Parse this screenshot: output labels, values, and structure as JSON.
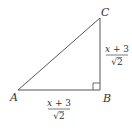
{
  "diagram": {
    "type": "right-triangle",
    "vertices": {
      "A": {
        "label": "A"
      },
      "B": {
        "label": "B"
      },
      "C": {
        "label": "C"
      }
    },
    "right_angle_at": "B",
    "sides": {
      "AB": {
        "numerator_var": "x",
        "numerator_rest": " + 3",
        "denominator": "2",
        "radical": "√"
      },
      "BC": {
        "numerator_var": "x",
        "numerator_rest": " + 3",
        "denominator": "2",
        "radical": "√"
      }
    },
    "colors": {
      "stroke": "#444444",
      "text": "#333333"
    }
  }
}
